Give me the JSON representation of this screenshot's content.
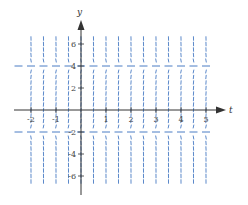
{
  "figure": {
    "title": ""
  },
  "axes": {
    "x_label": "t",
    "y_label": "y",
    "x_ticks": [
      {
        "value": -2,
        "label": "-2"
      },
      {
        "value": -1,
        "label": "-1"
      },
      {
        "value": 1,
        "label": "1"
      },
      {
        "value": 2,
        "label": "2"
      },
      {
        "value": 3,
        "label": "3"
      },
      {
        "value": 4,
        "label": "4"
      },
      {
        "value": 5,
        "label": "5"
      }
    ],
    "y_ticks": [
      {
        "value": 6,
        "label": "6"
      },
      {
        "value": 4,
        "label": "4"
      },
      {
        "value": 2,
        "label": "2"
      },
      {
        "value": -2,
        "label": "-2"
      },
      {
        "value": -4,
        "label": "-4"
      },
      {
        "value": -6,
        "label": "-6"
      }
    ],
    "x_range": [
      -2.5,
      5.5
    ],
    "y_range": [
      -7.5,
      7.5
    ]
  },
  "slope_field": {
    "t_start": -2,
    "t_end": 5,
    "t_step": 0.5,
    "y_start": -6.5,
    "y_end": 6.5,
    "y_step": 0.5,
    "equilibria": [
      4,
      -2
    ],
    "regions": [
      {
        "range": "y > 4",
        "slope_sign": "negative"
      },
      {
        "range": "-2 < y < 4",
        "slope_sign": "positive"
      },
      {
        "range": "y < -2",
        "slope_sign": "negative"
      }
    ],
    "color": "#4a7cc4"
  },
  "colors": {
    "axis": "#333333",
    "field": "#4a7cc4"
  }
}
